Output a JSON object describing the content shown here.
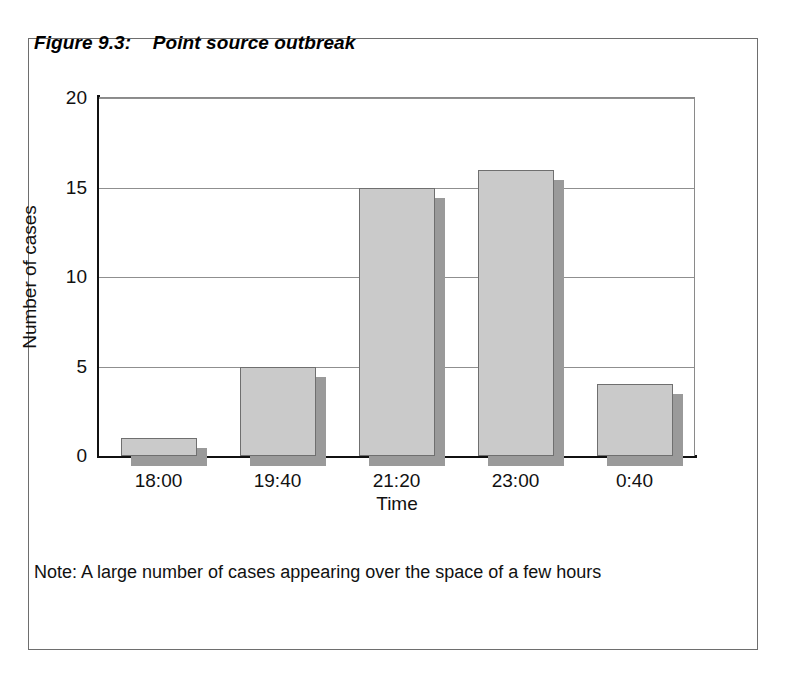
{
  "figure": {
    "title_label": "Figure 9.3:",
    "title_text": "Point source outbreak",
    "title_full": "Figure 9.3:    Point source outbreak",
    "note": "Note: A large number of cases appearing over the space of a few hours"
  },
  "chart_data": {
    "type": "bar",
    "title": "Point source outbreak",
    "categories": [
      "18:00",
      "19:40",
      "21:20",
      "23:00",
      "0:40"
    ],
    "values": [
      1,
      5,
      15,
      16,
      4
    ],
    "xlabel": "Time",
    "ylabel": "Number of cases",
    "ylim": [
      0,
      20
    ],
    "yticks": [
      0,
      5,
      10,
      15,
      20
    ],
    "ytick_labels": [
      "0",
      "5",
      "10",
      "15",
      "20"
    ],
    "grid": true,
    "legend": false,
    "bar_fill_color": "#cacaca",
    "bar_edge_color": "#6f6f6f",
    "bar_shadow_color": "#9a9a9a",
    "axis_color": "#111111",
    "gridline_color": "#8f8f8f"
  }
}
